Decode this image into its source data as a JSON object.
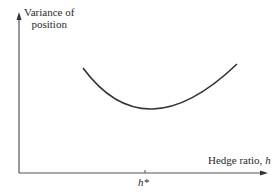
{
  "diagram": {
    "y_axis": {
      "label_line1": "Variance of",
      "label_line2": "position"
    },
    "x_axis": {
      "label_text": "Hedge ratio, ",
      "label_var": "h"
    },
    "marker": {
      "label": "h*"
    },
    "curve": {
      "shape": "U-shaped",
      "min_at": "h*"
    },
    "colors": {
      "line": "#333333",
      "background": "#ffffff"
    }
  }
}
